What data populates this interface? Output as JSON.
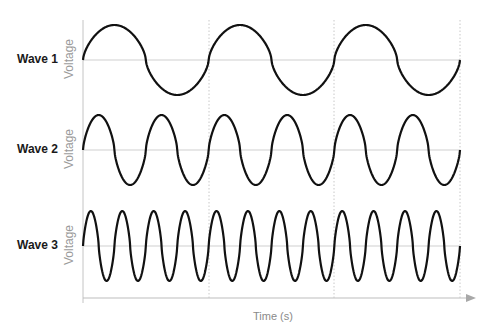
{
  "chart_data": {
    "type": "line",
    "title": "",
    "xlabel": "Time (s)",
    "ylabel": "Voltage",
    "grid": "vertical dotted lines at 1/3 and 2/3 of time span",
    "series": [
      {
        "name": "Wave 1",
        "cycles": 3,
        "relative_frequency": 1,
        "amplitude": 1
      },
      {
        "name": "Wave 2",
        "cycles": 6,
        "relative_frequency": 2,
        "amplitude": 1
      },
      {
        "name": "Wave 3",
        "cycles": 12,
        "relative_frequency": 4,
        "amplitude": 1
      }
    ]
  },
  "labels": {
    "wave1": "Wave 1",
    "wave2": "Wave 2",
    "wave3": "Wave 3",
    "voltage": "Voltage",
    "time": "Time (s)"
  },
  "colors": {
    "wave": "#111111",
    "axis": "#bdbdbd",
    "grid": "#c8c8c8",
    "arrow": "#a8a8a8"
  }
}
